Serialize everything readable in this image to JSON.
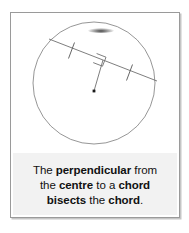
{
  "card": {
    "background_color": "#ffffff",
    "border_color": "#9a9a9a"
  },
  "diagram": {
    "name": "circle-with-perpendicular-from-centre-to-chord",
    "stroke_color": "#6f6f6f",
    "mark_color": "#555555",
    "circle": {
      "cx": 92,
      "cy": 80,
      "r": 61
    },
    "centre_point": {
      "x": 92,
      "y": 88,
      "label": ""
    },
    "chord": {
      "x1": 47,
      "y1": 36,
      "x2": 155,
      "y2": 78
    },
    "perpendicular": {
      "x1": 92,
      "y1": 88,
      "x2": 101,
      "y2": 57
    },
    "right_angle_marker": true,
    "tick_marks": [
      {
        "name": "tick-left-half"
      },
      {
        "name": "tick-right-half"
      }
    ]
  },
  "caption": {
    "line1": [
      {
        "text": "The ",
        "bold": false
      },
      {
        "text": "perpendicular",
        "bold": true
      },
      {
        "text": " from",
        "bold": false
      }
    ],
    "line2": [
      {
        "text": "the ",
        "bold": false
      },
      {
        "text": "centre",
        "bold": true
      },
      {
        "text": " to a ",
        "bold": false
      },
      {
        "text": "chord",
        "bold": true
      }
    ],
    "line3": [
      {
        "text": "bisects",
        "bold": true
      },
      {
        "text": " the ",
        "bold": false
      },
      {
        "text": "chord",
        "bold": true
      },
      {
        "text": ".",
        "bold": false
      }
    ],
    "plain_text": "The perpendicular from the centre to a chord bisects the chord.",
    "background_color": "#f2f2f2",
    "text_color": "#111111"
  }
}
